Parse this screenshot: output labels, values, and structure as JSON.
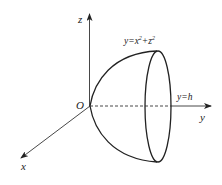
{
  "diagram": {
    "type": "3d-paraboloid-solid",
    "axes": {
      "z": {
        "label": "z"
      },
      "y": {
        "label": "y"
      },
      "x": {
        "label": "x"
      },
      "origin": {
        "label": "O"
      }
    },
    "surface_label": "y=x²+z²",
    "surface_label_parts": {
      "base": "y=x",
      "sup1": "2",
      "mid": "+z",
      "sup2": "2"
    },
    "plane_label": "y=h",
    "colors": {
      "stroke": "#222222",
      "background": "#ffffff"
    }
  }
}
